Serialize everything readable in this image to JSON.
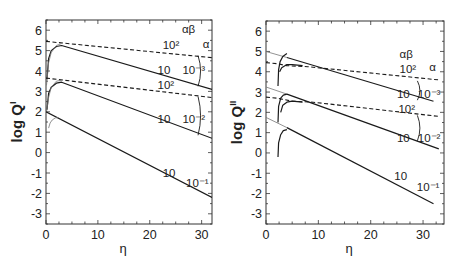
{
  "chart_data": [
    {
      "type": "line",
      "panel": "left",
      "ylabel": "log Q",
      "ylabel_superscript": "I",
      "xlabel": "η",
      "xlim": [
        0,
        32
      ],
      "ylim": [
        -3.5,
        6.5
      ],
      "xticks": [
        0,
        10,
        20,
        30
      ],
      "yticks": [
        -3,
        -2,
        -1,
        0,
        1,
        2,
        3,
        4,
        5,
        6
      ],
      "grid": false,
      "legend_headers": {
        "alpha_beta": "αβ",
        "alpha": "α"
      },
      "series": [
        {
          "name": "α=10^-3, αβ=10^2",
          "style": "dashed",
          "x": [
            0,
            32
          ],
          "y": [
            5.45,
            4.65
          ]
        },
        {
          "name": "α=10^-3, αβ=10",
          "style": "solid",
          "x": [
            0.2,
            0.5,
            1,
            2,
            3,
            32
          ],
          "y": [
            3.6,
            4.6,
            5.0,
            5.2,
            5.25,
            3.1
          ]
        },
        {
          "name": "α=10^-3, αβ=10 (transient)",
          "style": "thin",
          "x": [
            0.1,
            0.5,
            1,
            2,
            3
          ],
          "y": [
            3.3,
            4.4,
            4.9,
            5.25,
            5.35
          ]
        },
        {
          "name": "α=10^-2, αβ=10^2",
          "style": "dashed",
          "x": [
            0,
            32
          ],
          "y": [
            3.65,
            2.7
          ]
        },
        {
          "name": "α=10^-2, αβ=10",
          "style": "solid",
          "x": [
            0.2,
            0.5,
            1,
            2,
            3,
            32
          ],
          "y": [
            2.1,
            2.9,
            3.2,
            3.4,
            3.45,
            0.7
          ]
        },
        {
          "name": "α=10^-2, αβ=10 (transient)",
          "style": "thin",
          "x": [
            0.1,
            0.5,
            1,
            2,
            3
          ],
          "y": [
            2.0,
            2.7,
            3.2,
            3.5,
            3.55
          ]
        },
        {
          "name": "α=10^-1, αβ=10",
          "style": "solid",
          "x": [
            0,
            32
          ],
          "y": [
            2.0,
            -2.2
          ]
        },
        {
          "name": "α=10^-1, αβ=10 (transient)",
          "style": "thin",
          "x": [
            0.5,
            0.8,
            1.2,
            1.8,
            2.4
          ],
          "y": [
            1.2,
            1.45,
            1.6,
            1.7,
            1.72
          ]
        }
      ],
      "annotations": [
        {
          "text": "αβ",
          "x": 26.2,
          "y": 5.85
        },
        {
          "text": "10²",
          "x": 22.5,
          "y": 5.1
        },
        {
          "text": "α",
          "x": 30.2,
          "y": 5.15
        },
        {
          "text": "10",
          "x": 21.5,
          "y": 3.85
        },
        {
          "text": "10⁻³",
          "x": 26.3,
          "y": 3.85
        },
        {
          "text": "10²",
          "x": 21.5,
          "y": 3.1
        },
        {
          "text": "10",
          "x": 21.5,
          "y": 1.45
        },
        {
          "text": "10⁻²",
          "x": 26.3,
          "y": 1.45
        },
        {
          "text": "10",
          "x": 22.5,
          "y": -1.2
        },
        {
          "text": "10⁻¹",
          "x": 27.0,
          "y": -1.7
        }
      ],
      "brackets": [
        {
          "x": 29.7,
          "y_top": 4.75,
          "y_bot": 3.25
        },
        {
          "x": 29.7,
          "y_top": 2.75,
          "y_bot": 0.85
        }
      ]
    },
    {
      "type": "line",
      "panel": "right",
      "ylabel": "log Q",
      "ylabel_superscript": "II",
      "xlabel": "η",
      "xlim": [
        0,
        34
      ],
      "ylim": [
        -3.5,
        6.5
      ],
      "xticks": [
        0,
        10,
        20,
        30
      ],
      "yticks": [
        -3,
        -2,
        -1,
        0,
        1,
        2,
        3,
        4,
        5,
        6
      ],
      "grid": false,
      "legend_headers": {
        "alpha_beta": "αβ",
        "alpha": "α"
      },
      "series": [
        {
          "name": "α=10^-3 asymptote",
          "style": "thin",
          "x": [
            0,
            4
          ],
          "y": [
            5.0,
            4.7
          ]
        },
        {
          "name": "α=10^-3, αβ=10",
          "style": "solid",
          "x": [
            4,
            32
          ],
          "y": [
            4.7,
            2.55
          ]
        },
        {
          "name": "α=10^-3, αβ=10^2",
          "style": "dashed",
          "x": [
            0,
            2,
            4,
            8,
            33
          ],
          "y": [
            4.45,
            4.4,
            4.3,
            4.25,
            3.6
          ]
        },
        {
          "name": "α=10^-3, αβ=10 (transient)",
          "style": "solid",
          "x": [
            2.3,
            2.4,
            2.7,
            3.2,
            4
          ],
          "y": [
            3.3,
            4.1,
            4.5,
            4.75,
            4.9
          ]
        },
        {
          "name": "α=10^-3, αβ=10^2 (transient)",
          "style": "solid",
          "x": [
            2.6,
            3,
            4,
            5,
            7
          ],
          "y": [
            4.0,
            4.2,
            4.35,
            4.35,
            4.3
          ]
        },
        {
          "name": "α=10^-2 asymptote",
          "style": "thin",
          "x": [
            0,
            4
          ],
          "y": [
            3.25,
            2.9
          ]
        },
        {
          "name": "α=10^-2, αβ=10",
          "style": "solid",
          "x": [
            4,
            33
          ],
          "y": [
            2.9,
            0.2
          ]
        },
        {
          "name": "α=10^-2, αβ=10^2",
          "style": "dashed",
          "x": [
            0,
            2,
            5,
            9,
            33
          ],
          "y": [
            2.75,
            2.7,
            2.55,
            2.5,
            1.8
          ]
        },
        {
          "name": "α=10^-2, αβ=10 (transient)",
          "style": "solid",
          "x": [
            2.3,
            2.4,
            2.8,
            3.3,
            4
          ],
          "y": [
            1.5,
            2.3,
            2.7,
            2.85,
            2.9
          ]
        },
        {
          "name": "α=10^-2, αβ=10^2 (transient)",
          "style": "solid",
          "x": [
            2.8,
            3.2,
            4,
            5,
            7
          ],
          "y": [
            2.0,
            2.35,
            2.5,
            2.55,
            2.5
          ]
        },
        {
          "name": "α=10^-1 asymptote",
          "style": "thin",
          "x": [
            0,
            4
          ],
          "y": [
            1.75,
            1.25
          ]
        },
        {
          "name": "α=10^-1, αβ=10",
          "style": "solid",
          "x": [
            4,
            32
          ],
          "y": [
            1.25,
            -2.5
          ]
        },
        {
          "name": "α=10^-1, αβ=10 (transient)",
          "style": "solid",
          "x": [
            2.3,
            2.4,
            2.8,
            3.3,
            4
          ],
          "y": [
            -0.2,
            0.5,
            0.9,
            1.1,
            1.15
          ]
        }
      ],
      "annotations": [
        {
          "text": "αβ",
          "x": 25.5,
          "y": 4.7
        },
        {
          "text": "10²",
          "x": 25.5,
          "y": 3.95
        },
        {
          "text": "α",
          "x": 31.2,
          "y": 4.05
        },
        {
          "text": "10",
          "x": 25.0,
          "y": 2.7
        },
        {
          "text": "10⁻³",
          "x": 29.0,
          "y": 2.7
        },
        {
          "text": "10²",
          "x": 25.3,
          "y": 1.95
        },
        {
          "text": "10",
          "x": 25.0,
          "y": 0.55
        },
        {
          "text": "10⁻²",
          "x": 29.0,
          "y": 0.55
        },
        {
          "text": "10",
          "x": 24.5,
          "y": -1.35
        },
        {
          "text": "10⁻¹",
          "x": 28.8,
          "y": -1.85
        }
      ],
      "brackets": [
        {
          "x": 29.3,
          "y_top": 3.55,
          "y_bot": 2.6
        },
        {
          "x": 29.3,
          "y_top": 1.85,
          "y_bot": 0.6
        }
      ]
    }
  ],
  "layout": {
    "panels": [
      {
        "left": 46,
        "top": 20,
        "right": 212,
        "bottom": 224
      },
      {
        "left": 266,
        "top": 21,
        "right": 444,
        "bottom": 224
      }
    ],
    "line_color": "#1a1a1a",
    "thin_color": "#777777"
  }
}
